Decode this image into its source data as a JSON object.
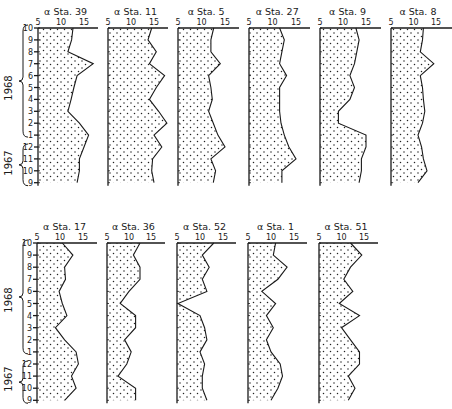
{
  "figure": {
    "row_labels": {
      "months": [
        "10",
        "9",
        "8",
        "7",
        "6",
        "5",
        "4",
        "3",
        "2",
        "1",
        "12",
        "11",
        "10",
        "9"
      ],
      "year_1968": "1968",
      "year_1967": "1967"
    },
    "x_ticks": [
      "5",
      "10",
      "15"
    ],
    "alpha_symbol": "α"
  },
  "chart_data": [
    {
      "type": "area",
      "title": "α Sta. 39",
      "station": "Sta. 39",
      "xlabel": "α",
      "xlim": [
        5,
        18
      ],
      "x_ticks": [
        5,
        10,
        15
      ],
      "y": [
        "Oct 1968",
        "Sep 1968",
        "Aug 1968",
        "Jul 1968",
        "Jun 1968",
        "May 1968",
        "Apr 1968",
        "Mar 1968",
        "Feb 1968",
        "Jan 1968",
        "Dec 1967",
        "Nov 1967",
        "Oct 1967",
        "Sep 1967"
      ],
      "values": [
        12.6,
        12.3,
        11.5,
        17.0,
        13.5,
        12.8,
        12.2,
        11.5,
        14.0,
        16.0,
        15.0,
        14.0,
        14.0,
        13.5
      ]
    },
    {
      "type": "area",
      "title": "α Sta. 11",
      "station": "Sta. 11",
      "xlabel": "α",
      "xlim": [
        5,
        18
      ],
      "x_ticks": [
        5,
        10,
        15
      ],
      "y": [
        "Oct 1968",
        "Sep 1968",
        "Aug 1968",
        "Jul 1968",
        "Jun 1968",
        "May 1968",
        "Apr 1968",
        "Mar 1968",
        "Feb 1968",
        "Jan 1968",
        "Dec 1967",
        "Nov 1967",
        "Oct 1967",
        "Sep 1967"
      ],
      "values": [
        14.5,
        13.7,
        15.5,
        14.0,
        17.3,
        15.5,
        14.0,
        16.0,
        17.8,
        15.0,
        16.7,
        14.7,
        14.5,
        15.0
      ]
    },
    {
      "type": "area",
      "title": "α Sta. 5",
      "station": "Sta. 5",
      "xlabel": "α",
      "xlim": [
        5,
        18
      ],
      "x_ticks": [
        5,
        10,
        15
      ],
      "y": [
        "Oct 1968",
        "Sep 1968",
        "Aug 1968",
        "Jul 1968",
        "Jun 1968",
        "May 1968",
        "Apr 1968",
        "Mar 1968",
        "Feb 1968",
        "Jan 1968",
        "Dec 1967",
        "Nov 1967",
        "Oct 1967",
        "Sep 1967"
      ],
      "values": [
        12.6,
        12.0,
        12.0,
        14.0,
        11.5,
        12.0,
        12.3,
        11.5,
        12.5,
        13.5,
        15.0,
        12.0,
        13.0,
        12.5
      ]
    },
    {
      "type": "area",
      "title": "α Sta. 27",
      "station": "Sta. 27",
      "xlabel": "α",
      "xlim": [
        5,
        18
      ],
      "x_ticks": [
        5,
        10,
        15
      ],
      "y": [
        "Oct 1968",
        "Sep 1968",
        "Aug 1968",
        "Jul 1968",
        "Jun 1968",
        "May 1968",
        "Apr 1968",
        "Mar 1968",
        "Feb 1968",
        "Jan 1968",
        "Dec 1967",
        "Nov 1967",
        "Oct 1967",
        "Sep 1967"
      ],
      "values": [
        11.5,
        12.5,
        12.0,
        11.5,
        13.0,
        11.5,
        11.5,
        11.5,
        11.8,
        12.5,
        13.5,
        15.0,
        12.0,
        12.0
      ]
    },
    {
      "type": "area",
      "title": "α Sta. 9",
      "station": "Sta. 9",
      "xlabel": "α",
      "xlim": [
        5,
        18
      ],
      "x_ticks": [
        5,
        10,
        15
      ],
      "y": [
        "Oct 1968",
        "Sep 1968",
        "Aug 1968",
        "Jul 1968",
        "Jun 1968",
        "May 1968",
        "Apr 1968",
        "Mar 1968",
        "Feb 1968",
        "Jan 1968",
        "Dec 1967",
        "Nov 1967",
        "Oct 1967",
        "Sep 1967"
      ],
      "values": [
        12.8,
        13.5,
        13.0,
        12.5,
        11.5,
        12.5,
        11.5,
        9.0,
        9.0,
        15.0,
        15.0,
        14.0,
        14.0,
        13.5
      ]
    },
    {
      "type": "area",
      "title": "α Sta. 8",
      "station": "Sta. 8",
      "xlabel": "α",
      "xlim": [
        5,
        18
      ],
      "x_ticks": [
        5,
        10,
        15
      ],
      "y": [
        "Oct 1968",
        "Sep 1968",
        "Aug 1968",
        "Jul 1968",
        "Jun 1968",
        "May 1968",
        "Apr 1968",
        "Mar 1968",
        "Feb 1968",
        "Jan 1968",
        "Dec 1967",
        "Nov 1967",
        "Oct 1967",
        "Sep 1967"
      ],
      "values": [
        12.2,
        12.0,
        11.5,
        14.5,
        11.5,
        12.0,
        12.2,
        12.5,
        12.0,
        11.0,
        11.8,
        12.2,
        13.0,
        11.0
      ]
    },
    {
      "type": "area",
      "title": "α Sta. 17",
      "station": "Sta. 17",
      "xlabel": "α",
      "xlim": [
        5,
        18
      ],
      "x_ticks": [
        5,
        10,
        15
      ],
      "y": [
        "Oct 1968",
        "Sep 1968",
        "Aug 1968",
        "Jul 1968",
        "Jun 1968",
        "May 1968",
        "Apr 1968",
        "Mar 1968",
        "Feb 1968",
        "Jan 1968",
        "Dec 1967",
        "Nov 1967",
        "Oct 1967",
        "Sep 1967"
      ],
      "values": [
        10.5,
        12.8,
        11.0,
        11.2,
        9.8,
        10.5,
        11.5,
        9.0,
        11.0,
        13.5,
        14.0,
        12.5,
        13.5,
        11.0
      ]
    },
    {
      "type": "area",
      "title": "α Sta. 36",
      "station": "Sta. 36",
      "xlabel": "α",
      "xlim": [
        5,
        18
      ],
      "x_ticks": [
        5,
        10,
        15
      ],
      "y": [
        "Oct 1968",
        "Sep 1968",
        "Aug 1968",
        "Jul 1968",
        "Jun 1968",
        "May 1968",
        "Apr 1968",
        "Mar 1968",
        "Feb 1968",
        "Jan 1968",
        "Dec 1967",
        "Nov 1967",
        "Oct 1967",
        "Sep 1967"
      ],
      "values": [
        12.5,
        11.0,
        12.5,
        12.5,
        10.0,
        8.0,
        11.5,
        11.5,
        9.0,
        10.5,
        9.5,
        7.5,
        11.5,
        11.5
      ]
    },
    {
      "type": "area",
      "title": "α Sta. 52",
      "station": "Sta. 52",
      "xlabel": "α",
      "xlim": [
        5,
        18
      ],
      "x_ticks": [
        5,
        10,
        15
      ],
      "y": [
        "Oct 1968",
        "Sep 1968",
        "Aug 1968",
        "Jul 1968",
        "Jun 1968",
        "May 1968",
        "Apr 1968",
        "Mar 1968",
        "Feb 1968",
        "Jan 1968",
        "Dec 1967",
        "Nov 1967",
        "Oct 1967",
        "Sep 1967"
      ],
      "values": [
        13.0,
        10.5,
        12.0,
        10.5,
        11.5,
        5.2,
        10.0,
        11.0,
        11.5,
        10.0,
        11.0,
        10.5,
        10.5,
        11.5
      ]
    },
    {
      "type": "area",
      "title": "α Sta. 1",
      "station": "Sta. 1",
      "xlabel": "α",
      "xlim": [
        5,
        18
      ],
      "x_ticks": [
        5,
        10,
        15
      ],
      "y": [
        "Oct 1968",
        "Sep 1968",
        "Aug 1968",
        "Jul 1968",
        "Jun 1968",
        "May 1968",
        "Apr 1968",
        "Mar 1968",
        "Feb 1968",
        "Jan 1968",
        "Dec 1967",
        "Nov 1967",
        "Oct 1967",
        "Sep 1967"
      ],
      "values": [
        11.0,
        10.5,
        13.5,
        11.5,
        8.0,
        11.0,
        9.0,
        10.5,
        9.0,
        10.0,
        12.0,
        12.5,
        11.5,
        10.0
      ]
    },
    {
      "type": "area",
      "title": "α Sta. 51",
      "station": "Sta. 51",
      "xlabel": "α",
      "xlim": [
        5,
        18
      ],
      "x_ticks": [
        5,
        10,
        15
      ],
      "y": [
        "Oct 1968",
        "Sep 1968",
        "Aug 1968",
        "Jul 1968",
        "Jun 1968",
        "May 1968",
        "Apr 1968",
        "Mar 1968",
        "Feb 1968",
        "Jan 1968",
        "Dec 1967",
        "Nov 1967",
        "Oct 1967",
        "Sep 1967"
      ],
      "values": [
        12.0,
        14.5,
        12.0,
        10.5,
        12.5,
        9.5,
        14.0,
        10.0,
        12.0,
        14.0,
        14.0,
        11.5,
        13.0,
        11.5
      ]
    }
  ],
  "layout_panels": [
    {
      "idx": 0,
      "x0": 38,
      "top": 28,
      "step": 11.9,
      "scale": 4.6,
      "axis_end": 98
    },
    {
      "idx": 1,
      "x0": 108,
      "top": 28,
      "step": 11.9,
      "scale": 4.6,
      "axis_end": 168
    },
    {
      "idx": 2,
      "x0": 178,
      "top": 28,
      "step": 11.9,
      "scale": 4.7,
      "axis_end": 239
    },
    {
      "idx": 3,
      "x0": 249,
      "top": 28,
      "step": 11.9,
      "scale": 4.7,
      "axis_end": 310
    },
    {
      "idx": 4,
      "x0": 320,
      "top": 28,
      "step": 11.9,
      "scale": 4.6,
      "axis_end": 381
    },
    {
      "idx": 5,
      "x0": 391,
      "top": 28,
      "step": 11.9,
      "scale": 4.5,
      "axis_end": 452
    },
    {
      "idx": 6,
      "x0": 37,
      "top": 243,
      "step": 12.1,
      "scale": 4.6,
      "axis_end": 97
    },
    {
      "idx": 7,
      "x0": 107,
      "top": 243,
      "step": 12.1,
      "scale": 4.4,
      "axis_end": 165
    },
    {
      "idx": 8,
      "x0": 177,
      "top": 243,
      "step": 12.1,
      "scale": 4.6,
      "axis_end": 236
    },
    {
      "idx": 9,
      "x0": 248,
      "top": 243,
      "step": 12.1,
      "scale": 4.6,
      "axis_end": 307
    },
    {
      "idx": 10,
      "x0": 319,
      "top": 243,
      "step": 12.1,
      "scale": 4.5,
      "axis_end": 378
    }
  ]
}
